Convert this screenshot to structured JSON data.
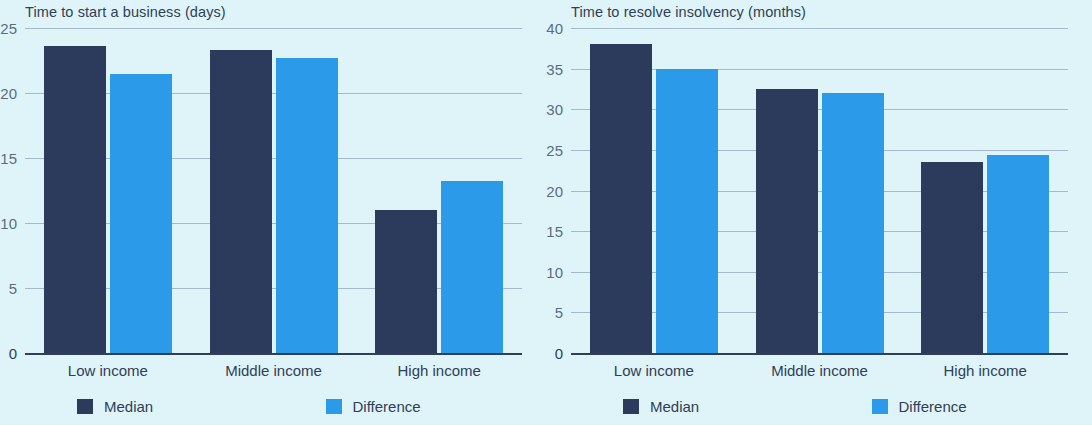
{
  "theme": {
    "background": "#dff4f9",
    "median_color": "#2c3a5c",
    "difference_color": "#2b9ae8",
    "text_color": "#2f3f56",
    "gridline_color": "#8fa7bd",
    "axis_color": "#2f3f56"
  },
  "charts": [
    {
      "id": "time-to-start-a-business",
      "title": "Time to start a business (days)",
      "chart_data": {
        "type": "bar",
        "title": "Time to start a business (days)",
        "xlabel": "",
        "ylabel": "days",
        "ylim": [
          0,
          25
        ],
        "yticks": [
          0,
          5,
          10,
          15,
          20,
          25
        ],
        "grid": true,
        "legend": "bottom",
        "categories": [
          "Low income",
          "Middle income",
          "High income"
        ],
        "series": [
          {
            "name": "Median",
            "color": "#2c3a5c",
            "values": [
              23.6,
              23.3,
              11.0
            ]
          },
          {
            "name": "Difference",
            "color": "#2b9ae8",
            "values": [
              21.5,
              22.7,
              13.2
            ]
          }
        ]
      },
      "ytick_labels": [
        "25",
        "20",
        "15",
        "10",
        "5",
        "0"
      ],
      "x_labels": [
        "Low income",
        "Middle income",
        "High income"
      ],
      "legend": [
        {
          "label": "Median",
          "color": "#2c3a5c"
        },
        {
          "label": "Difference",
          "color": "#2b9ae8"
        }
      ]
    },
    {
      "id": "time-to-resolve-insolvency",
      "title": "Time to resolve insolvency (months)",
      "chart_data": {
        "type": "bar",
        "title": "Time to resolve insolvency (months)",
        "xlabel": "",
        "ylabel": "months",
        "ylim": [
          0,
          40
        ],
        "yticks": [
          0,
          5,
          10,
          15,
          20,
          25,
          30,
          35,
          40
        ],
        "grid": true,
        "legend": "bottom",
        "categories": [
          "Low income",
          "Middle income",
          "High income"
        ],
        "series": [
          {
            "name": "Median",
            "color": "#2c3a5c",
            "values": [
              38.0,
              32.5,
              23.5
            ]
          },
          {
            "name": "Difference",
            "color": "#2b9ae8",
            "values": [
              35.0,
              32.0,
              24.4
            ]
          }
        ]
      },
      "ytick_labels": [
        "40",
        "35",
        "30",
        "25",
        "20",
        "15",
        "10",
        "5",
        "0"
      ],
      "x_labels": [
        "Low income",
        "Middle income",
        "High income"
      ],
      "legend": [
        {
          "label": "Median",
          "color": "#2c3a5c"
        },
        {
          "label": "Difference",
          "color": "#2b9ae8"
        }
      ]
    }
  ]
}
